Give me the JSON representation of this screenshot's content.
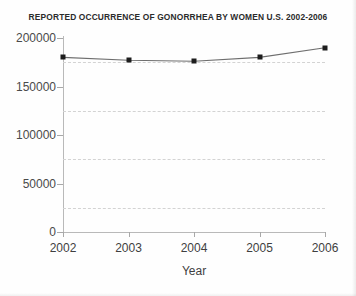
{
  "chart_data": {
    "type": "line",
    "title": "REPORTED OCCURRENCE OF GONORRHEA BY WOMEN U.S. 2002-2006",
    "xlabel": "Year",
    "ylabel": "",
    "categories": [
      "2002",
      "2003",
      "2004",
      "2005",
      "2006"
    ],
    "values": [
      180000,
      177000,
      176000,
      180000,
      190000
    ],
    "ylim": [
      0,
      200000
    ],
    "ytick_labels": [
      "0",
      "50000",
      "100000",
      "150000",
      "200000"
    ],
    "ytick_values": [
      0,
      50000,
      100000,
      150000,
      200000
    ],
    "minor_gridline_values": [
      25000,
      75000,
      125000,
      175000
    ],
    "grid": true,
    "legend": "none",
    "line_color": "#6e6e6e",
    "marker_color": "#1d1d1d",
    "marker_shape": "square"
  }
}
